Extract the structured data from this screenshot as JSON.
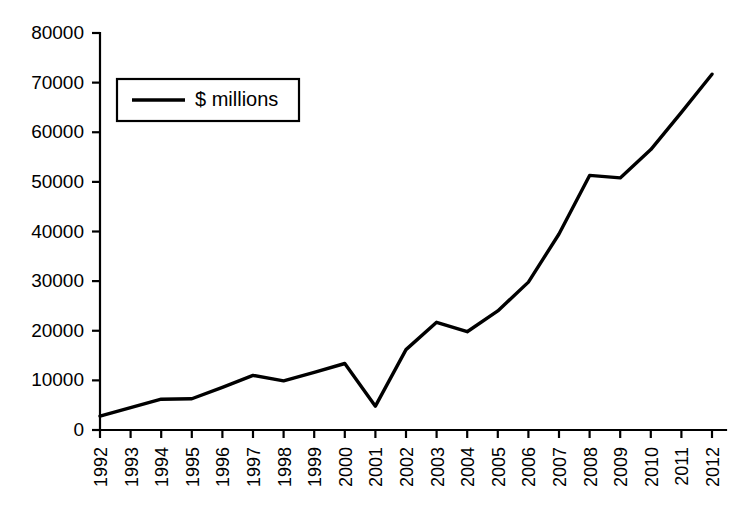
{
  "chart_data": {
    "type": "line",
    "title": "",
    "subtitle": "",
    "xlabel": "",
    "ylabel": "",
    "categories": [
      "1992",
      "1993",
      "1994",
      "1995",
      "1996",
      "1997",
      "1998",
      "1999",
      "2000",
      "2001",
      "2002",
      "2003",
      "2004",
      "2005",
      "2006",
      "2007",
      "2008",
      "2009",
      "2010",
      "2011",
      "2012"
    ],
    "series": [
      {
        "name": "$ millions",
        "color": "#000000",
        "values": [
          2800,
          4500,
          6200,
          6300,
          8600,
          11000,
          9900,
          11600,
          13400,
          4800,
          16200,
          21700,
          19800,
          24000,
          29800,
          39500,
          51300,
          50800,
          56500,
          64000,
          71700
        ]
      }
    ],
    "ylim": [
      0,
      80000
    ],
    "yticks": [
      0,
      10000,
      20000,
      30000,
      40000,
      50000,
      60000,
      70000,
      80000
    ],
    "ytick_labels": [
      "0",
      "10000",
      "20000",
      "30000",
      "40000",
      "50000",
      "60000",
      "70000",
      "80000"
    ],
    "grid": false,
    "legend": {
      "position": "upper-left-inside",
      "entries": [
        "$ millions"
      ],
      "boxed": true
    },
    "xtick_rotation": 90,
    "axis_color": "#000000",
    "background": "#ffffff"
  }
}
